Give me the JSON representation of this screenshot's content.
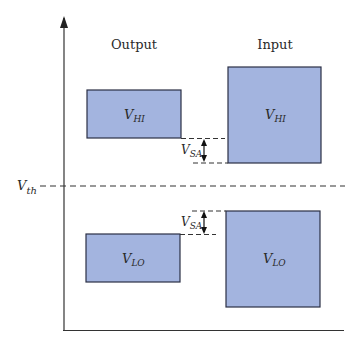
{
  "diagram": {
    "type": "noise-margin-diagram",
    "columns": {
      "output": "Output",
      "input": "Input"
    },
    "threshold": {
      "label": "V",
      "sub": "th"
    },
    "boxes": {
      "output_high": {
        "label": "V",
        "sub": "HI"
      },
      "input_high": {
        "label": "V",
        "sub": "HI"
      },
      "output_low": {
        "label": "V",
        "sub": "LO"
      },
      "input_low": {
        "label": "V",
        "sub": "LO"
      }
    },
    "margins": {
      "top": {
        "label": "V",
        "sub": "SA"
      },
      "bottom": {
        "label": "V",
        "sub": "SA"
      }
    },
    "colors": {
      "box_fill": "#a3b4df",
      "box_stroke": "#2b2f45",
      "line": "#333333"
    }
  }
}
